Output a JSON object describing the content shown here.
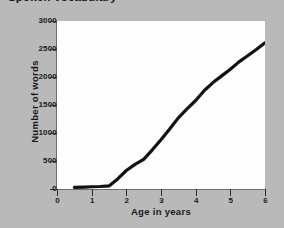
{
  "chart_data": {
    "type": "line",
    "title": "Spoken vocabulary",
    "xlabel": "Age in years",
    "ylabel": "Number of words",
    "xlim": [
      0,
      6
    ],
    "ylim": [
      0,
      3000
    ],
    "grid": false,
    "legend": null,
    "x_ticks": [
      "0",
      "1",
      "2",
      "3",
      "4",
      "5",
      "6"
    ],
    "y_ticks": [
      "0",
      "500",
      "1000",
      "1500",
      "2000",
      "2500",
      "3000"
    ],
    "series": [
      {
        "name": "Spoken vocabulary",
        "color": "#111111",
        "x": [
          0.5,
          0.8,
          1.0,
          1.25,
          1.5,
          1.75,
          2.0,
          2.25,
          2.5,
          2.75,
          3.0,
          3.25,
          3.5,
          3.75,
          4.0,
          4.25,
          4.5,
          4.75,
          5.0,
          5.25,
          5.5,
          5.75,
          6.0
        ],
        "values": [
          30,
          35,
          40,
          45,
          55,
          180,
          330,
          440,
          530,
          700,
          880,
          1070,
          1270,
          1430,
          1580,
          1760,
          1900,
          2020,
          2140,
          2270,
          2380,
          2490,
          2610
        ]
      }
    ]
  },
  "axes": {
    "y_tick_positions_px": [
      168,
      140,
      112,
      84,
      56,
      28,
      0
    ],
    "x_tick_positions_px": [
      0,
      34.67,
      69.33,
      104,
      138.67,
      173.33,
      208
    ]
  },
  "colors": {
    "background": "#b9b9b9",
    "plot_background": "#fdfdfd",
    "line": "#111111",
    "text": "#18181c",
    "axis": "#6d6d6d"
  }
}
